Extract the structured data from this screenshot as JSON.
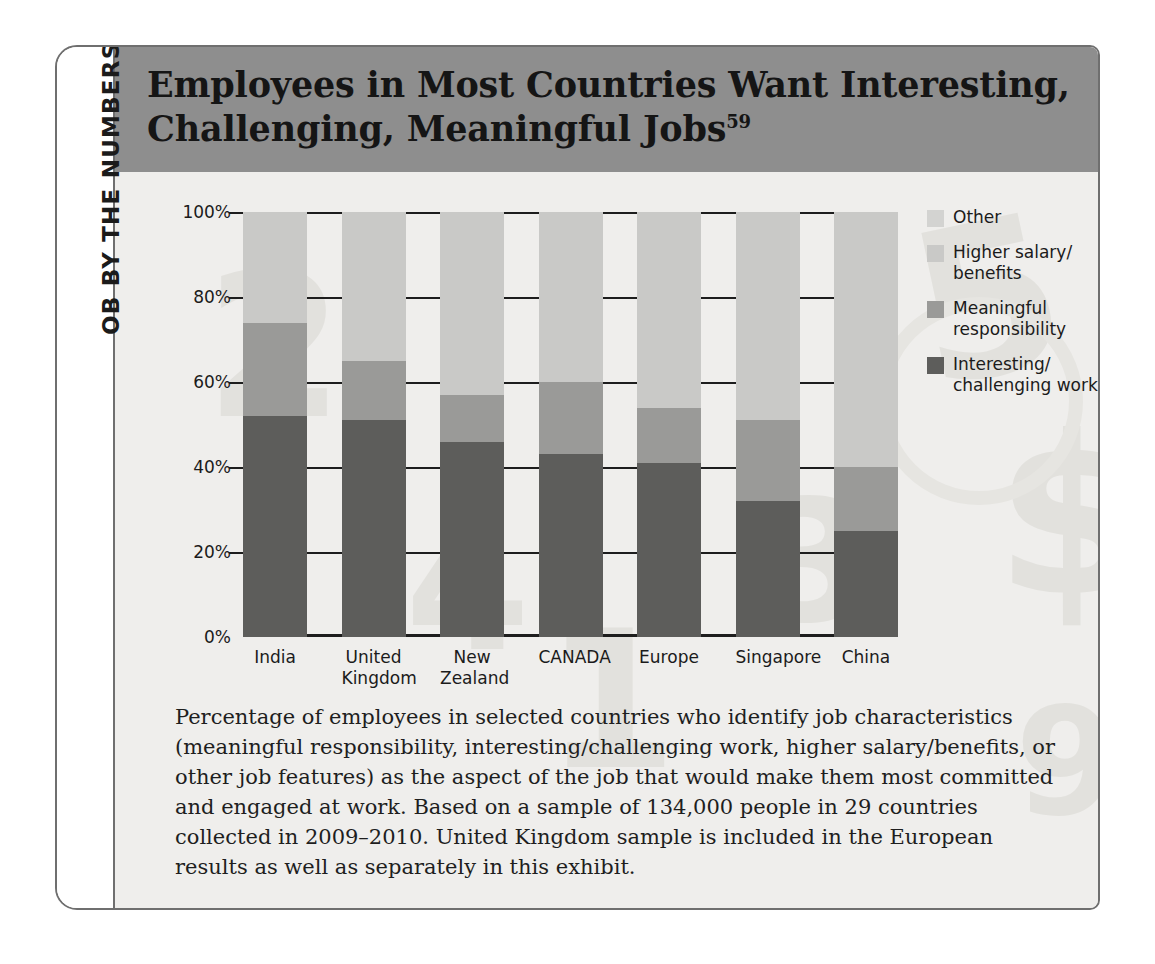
{
  "sidebar": {
    "label": "OB BY THE NUMBERS"
  },
  "header": {
    "title_line1": "Employees in Most Countries Want Interesting,",
    "title_line2": "Challenging, Meaningful Jobs",
    "title_superscript": "59"
  },
  "caption": {
    "text": "Percentage of employees in selected countries who identify job characteristics (meaningful responsibility, interesting/challenging work, higher salary/benefits, or other job features) as the aspect of the job that would make them most committed and engaged at work. Based on a sample of 134,000 people in 29 countries collected in 2009–2010. United Kingdom sample is included in the European results as well as separately in this exhibit."
  },
  "legend": {
    "items": [
      {
        "label": "Other",
        "color": "#d3d3d1"
      },
      {
        "label": "Higher salary/\nbenefits",
        "color": "#c9c9c7"
      },
      {
        "label": "Meaningful\nresponsibility",
        "color": "#9a9a98"
      },
      {
        "label": "Interesting/\nchallenging work",
        "color": "#5d5d5b"
      }
    ]
  },
  "chart_data": {
    "type": "bar",
    "subtype": "stacked-bar-100",
    "xlabel": "",
    "ylabel": "",
    "ylim": [
      0,
      100
    ],
    "ytick_labels": [
      "0%",
      "20%",
      "40%",
      "60%",
      "80%",
      "100%"
    ],
    "ytick_values": [
      0,
      20,
      40,
      60,
      80,
      100
    ],
    "grid": true,
    "legend_position": "right",
    "categories": [
      "India",
      "United Kingdom",
      "New Zealand",
      "CANADA",
      "Europe",
      "Singapore",
      "China"
    ],
    "category_lines": [
      [
        "India"
      ],
      [
        "United",
        "Kingdom"
      ],
      [
        "New",
        "Zealand"
      ],
      [
        "CANADA"
      ],
      [
        "Europe"
      ],
      [
        "Singapore"
      ],
      [
        "China"
      ]
    ],
    "series": [
      {
        "name": "Interesting/challenging work",
        "color": "#5d5d5b",
        "values": [
          52,
          51,
          46,
          43,
          41,
          32,
          25
        ]
      },
      {
        "name": "Meaningful responsibility",
        "color": "#9a9a98",
        "values": [
          22,
          14,
          11,
          17,
          13,
          19,
          15
        ]
      },
      {
        "name": "Higher salary/benefits",
        "color": "#c9c9c7",
        "values": [
          26,
          35,
          43,
          40,
          46,
          49,
          60
        ]
      },
      {
        "name": "Other",
        "color": "#d3d3d1",
        "values": [
          0,
          0,
          0,
          0,
          0,
          0,
          0
        ]
      }
    ],
    "cumulative_tops": {
      "interesting": [
        52,
        51,
        46,
        43,
        41,
        32,
        25
      ],
      "meaningful": [
        74,
        65,
        57,
        60,
        54,
        51,
        40
      ],
      "salary": [
        100,
        100,
        100,
        100,
        100,
        100,
        100
      ]
    }
  },
  "colors": {
    "header_band": "#8e8e8e",
    "frame_border": "#6f6f6f",
    "panel_bg": "#efeeec",
    "axis": "#1d1d1d"
  }
}
